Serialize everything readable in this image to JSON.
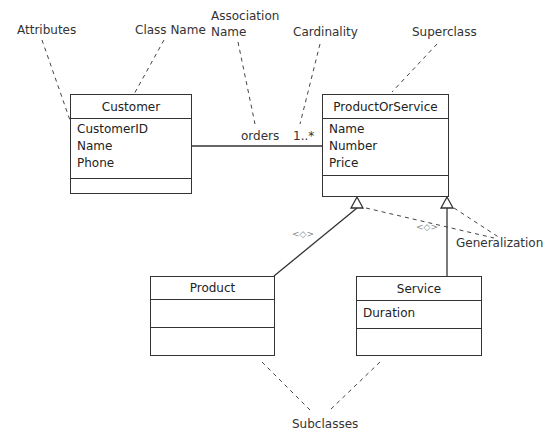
{
  "classes": [
    {
      "id": "customer",
      "name": "Customer",
      "attributes": [
        "CustomerID",
        "Name",
        "Phone"
      ]
    },
    {
      "id": "product-or-service",
      "name": "ProductOrService",
      "attributes": [
        "Name",
        "Number",
        "Price"
      ]
    },
    {
      "id": "product",
      "name": "Product",
      "attributes": []
    },
    {
      "id": "service",
      "name": "Service",
      "attributes": [
        "Duration"
      ]
    }
  ],
  "association": {
    "name": "orders",
    "cardinality": "1..*"
  },
  "stereotypes": [
    "<◇>",
    "<◇>"
  ],
  "annotations": {
    "attributes": "Attributes",
    "class_name": "Class Name",
    "association_name_line1": "Association",
    "association_name_line2": "Name",
    "cardinality": "Cardinality",
    "superclass": "Superclass",
    "generalization": "Generalization",
    "subclasses": "Subclasses"
  }
}
